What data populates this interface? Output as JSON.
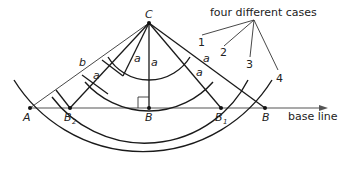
{
  "diagram": {
    "title_annotation": "four different cases",
    "points": {
      "C": "C",
      "A": "A",
      "B2": "B",
      "B2_sub": "2",
      "B": "B",
      "B1": "B",
      "B1_sub": "1",
      "B_right": "B"
    },
    "segment_labels": {
      "b": "b",
      "a": "a"
    },
    "cases": [
      "1",
      "2",
      "3",
      "4"
    ],
    "base_line_label": "base line",
    "colors": {
      "stroke": "#1a1a1a",
      "base_line": "#555555",
      "background": "#ffffff"
    }
  }
}
